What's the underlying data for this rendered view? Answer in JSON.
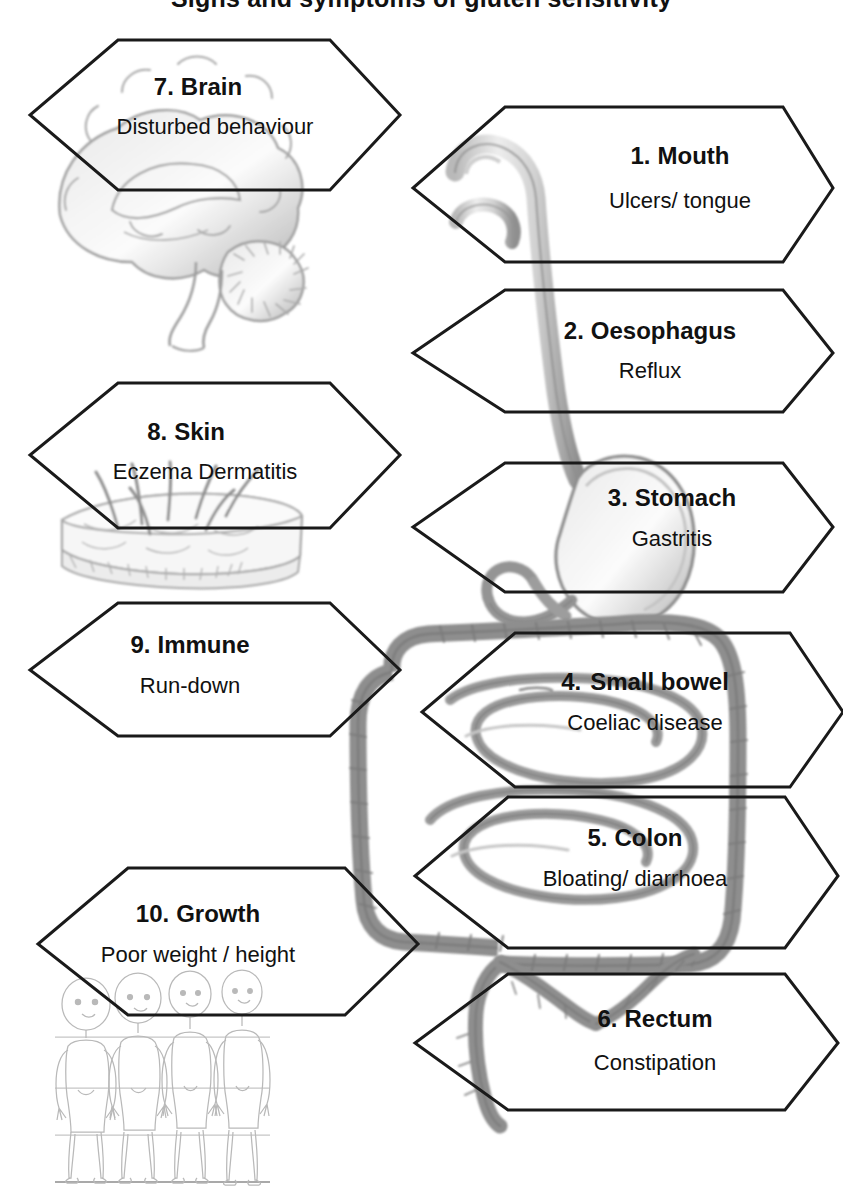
{
  "title": "Signs and symptoms of gluten sensitivity",
  "title_visible_fragment": "(title cropped off top edge)",
  "diagram": {
    "style": "pencil sketch line art, greyscale",
    "illustrations": [
      {
        "name": "brain-illustration",
        "label": "sagittal brain sketch"
      },
      {
        "name": "skin-illustration",
        "label": "skin cross-section with hairs"
      },
      {
        "name": "growth-children-illustration",
        "label": "four child figures with height reference lines"
      },
      {
        "name": "gi-tract-illustration",
        "label": "mouth, oesophagus, stomach, small bowel, colon, rectum"
      }
    ]
  },
  "callouts": [
    {
      "id": "mouth",
      "number": "1.",
      "title": "Mouth",
      "subtitle": "Ulcers/ tongue",
      "side": "right"
    },
    {
      "id": "oesophagus",
      "number": "2.",
      "title": "Oesophagus",
      "subtitle": "Reflux",
      "side": "right"
    },
    {
      "id": "stomach",
      "number": "3.",
      "title": "Stomach",
      "subtitle": "Gastritis",
      "side": "right"
    },
    {
      "id": "small-bowel",
      "number": "4.",
      "title": "Small bowel",
      "subtitle": "Coeliac disease",
      "side": "right"
    },
    {
      "id": "colon",
      "number": "5.",
      "title": "Colon",
      "subtitle": "Bloating/ diarrhoea",
      "side": "right"
    },
    {
      "id": "rectum",
      "number": "6.",
      "title": "Rectum",
      "subtitle": "Constipation",
      "side": "right"
    },
    {
      "id": "brain",
      "number": "7.",
      "title": "Brain",
      "subtitle": "Disturbed behaviour",
      "side": "left"
    },
    {
      "id": "skin",
      "number": "8.",
      "title": "Skin",
      "subtitle": "Eczema Dermatitis",
      "side": "left"
    },
    {
      "id": "immune",
      "number": "9.",
      "title": "Immune",
      "subtitle": "Run-down",
      "side": "left"
    },
    {
      "id": "growth",
      "number": "10.",
      "title": "Growth",
      "subtitle": "Poor weight / height",
      "side": "left"
    }
  ],
  "colors": {
    "outline": "#1a1a1a",
    "sketch_dark": "#6e6e6e",
    "sketch_mid": "#9a9a9a",
    "sketch_light": "#c8c8c8",
    "background": "#ffffff",
    "text": "#111111"
  }
}
